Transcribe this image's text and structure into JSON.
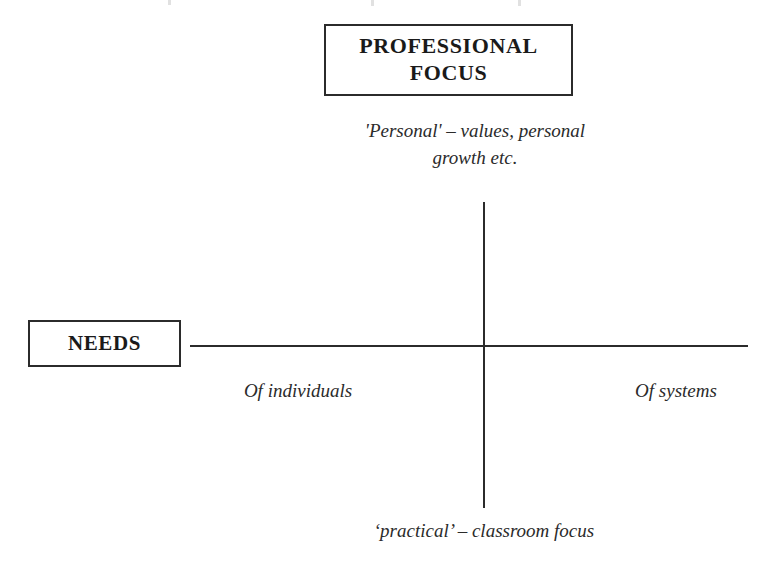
{
  "diagram": {
    "type": "quadrant-axes",
    "background_color": "#ffffff",
    "line_color": "#2b2b2b",
    "text_color": "#1a1a1a",
    "boxes": {
      "professional_focus": {
        "label": "PROFESSIONAL\nFOCUS",
        "style": "bold-serif-boxed",
        "position": "top-center"
      },
      "needs": {
        "label": "NEEDS",
        "style": "bold-serif-boxed",
        "position": "left-of-horizontal-axis"
      }
    },
    "axis_labels": {
      "vertical_top": "'Personal' – values, personal\ngrowth etc.",
      "vertical_bottom": "‘practical’ – classroom focus",
      "horizontal_left": "Of individuals",
      "horizontal_right": "Of systems"
    },
    "axes": {
      "vertical": {
        "x": 484,
        "y_top": 202,
        "y_bottom": 508
      },
      "horizontal": {
        "y": 346,
        "x_left": 190,
        "x_right": 748
      },
      "intersection": {
        "x": 484,
        "y": 346
      }
    }
  }
}
